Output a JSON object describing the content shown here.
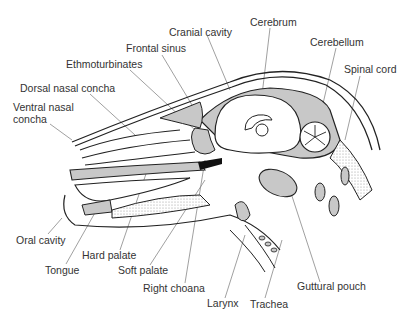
{
  "diagram": {
    "colors": {
      "outline": "#222222",
      "tissue": "#c8c8c8",
      "stipple": "#e0e0e0",
      "leader": "#888888"
    },
    "labels": [
      {
        "id": "cranial-cavity",
        "text": "Cranial cavity",
        "x": 169,
        "y": 26
      },
      {
        "id": "cerebrum",
        "text": "Cerebrum",
        "x": 250,
        "y": 16
      },
      {
        "id": "frontal-sinus",
        "text": "Frontal sinus",
        "x": 126,
        "y": 42
      },
      {
        "id": "cerebellum",
        "text": "Cerebellum",
        "x": 310,
        "y": 36
      },
      {
        "id": "ethmoturbinates",
        "text": "Ethmoturbinates",
        "x": 66,
        "y": 58
      },
      {
        "id": "spinal-cord",
        "text": "Spinal cord",
        "x": 344,
        "y": 63
      },
      {
        "id": "dorsal-nasal-concha",
        "text": "Dorsal nasal concha",
        "x": 20,
        "y": 82
      },
      {
        "id": "ventral-nasal-concha",
        "text": "Ventral nasal\nconcha",
        "x": 13,
        "y": 101
      },
      {
        "id": "oral-cavity",
        "text": "Oral cavity",
        "x": 16,
        "y": 234
      },
      {
        "id": "hard-palate",
        "text": "Hard palate",
        "x": 82,
        "y": 249
      },
      {
        "id": "tongue",
        "text": "Tongue",
        "x": 45,
        "y": 264
      },
      {
        "id": "soft-palate",
        "text": "Soft palate",
        "x": 118,
        "y": 264
      },
      {
        "id": "right-choana",
        "text": "Right choana",
        "x": 143,
        "y": 282
      },
      {
        "id": "guttural-pouch",
        "text": "Guttural pouch",
        "x": 297,
        "y": 280
      },
      {
        "id": "larynx",
        "text": "Larynx",
        "x": 207,
        "y": 297
      },
      {
        "id": "trachea",
        "text": "Trachea",
        "x": 250,
        "y": 298
      }
    ]
  }
}
